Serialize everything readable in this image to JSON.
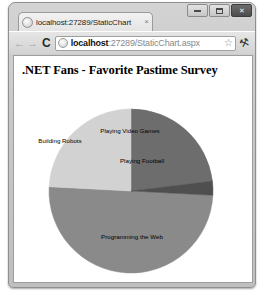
{
  "browser": {
    "tab": {
      "title": "localhost:27289/StaticChart",
      "favicon": "globe-icon",
      "close": "×"
    },
    "window_controls": {
      "minimize": "minimize-icon",
      "maximize": "maximize-icon",
      "close": "✕"
    },
    "toolbar": {
      "back": "←",
      "forward": "→",
      "reload": "C",
      "bookmark": "☆",
      "menu": "⚒",
      "address": {
        "host": "localhost",
        "path": ":27289/StaticChart.aspx",
        "full": "localhost:27289/StaticChart.aspx",
        "site_icon": "page-icon"
      }
    }
  },
  "page": {
    "heading": ".NET Fans - Favorite Pastime Survey"
  },
  "chart_data": {
    "type": "pie",
    "title": ".NET Fans - Favorite Pastime Survey",
    "categories": [
      "Programming the Web",
      "Playing Video Games",
      "Building Robots",
      "Playing Football"
    ],
    "values": [
      50,
      23,
      20,
      7
    ],
    "colors": [
      "#8a8a8a",
      "#6d6d6d",
      "#d2d2d2",
      "#4f4f4f"
    ],
    "slices": [
      {
        "label": "Programming the Web",
        "value": 50,
        "color": "#8a8a8a",
        "start_angle": 93,
        "end_angle": 273,
        "label_x": 118,
        "label_y": 143
      },
      {
        "label": "Playing Video Games",
        "value": 23,
        "color": "#6d6d6d",
        "start_angle": 0,
        "end_angle": 83,
        "label_x": 116,
        "label_y": 37
      },
      {
        "label": "Building Robots",
        "value": 20,
        "color": "#d2d2d2",
        "start_angle": 273,
        "end_angle": 360,
        "label_x": 46,
        "label_y": 47
      },
      {
        "label": "Playing Football",
        "value": 7,
        "color": "#4f4f4f",
        "start_angle": 83,
        "end_angle": 93,
        "label_x": 128,
        "label_y": 67
      }
    ],
    "legend": "none",
    "labels_position": "inside",
    "center_x": 117,
    "center_y": 95,
    "radius": 82
  }
}
